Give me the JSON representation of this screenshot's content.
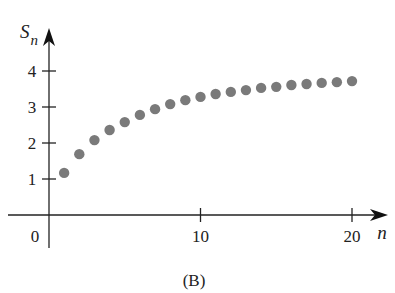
{
  "chart_data": {
    "type": "scatter",
    "title": "",
    "caption": "(B)",
    "xlabel": "n",
    "ylabel": "S",
    "ylabel_subscript": "n",
    "x": [
      1,
      2,
      3,
      4,
      5,
      6,
      7,
      8,
      9,
      10,
      11,
      12,
      13,
      14,
      15,
      16,
      17,
      18,
      19,
      20
    ],
    "series": [
      {
        "name": "S_n",
        "values": [
          1.17,
          1.69,
          2.08,
          2.36,
          2.58,
          2.78,
          2.94,
          3.08,
          3.19,
          3.28,
          3.36,
          3.42,
          3.47,
          3.53,
          3.56,
          3.61,
          3.64,
          3.67,
          3.69,
          3.72
        ]
      }
    ],
    "xticks": [
      0,
      10,
      20
    ],
    "xtick_labels": [
      "0",
      "10",
      "20"
    ],
    "yticks": [
      1,
      2,
      3,
      4
    ],
    "ytick_labels": [
      "1",
      "2",
      "3",
      "4"
    ],
    "xlim": [
      -1.7,
      22
    ],
    "ylim": [
      -0.5,
      4.7
    ],
    "grid": false,
    "legend": "none",
    "marker_color": "#7a7a7a"
  }
}
